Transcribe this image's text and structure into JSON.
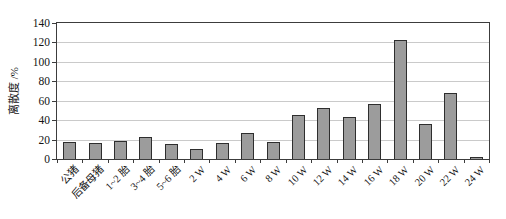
{
  "chart_data": {
    "type": "bar",
    "title": "",
    "xlabel": "",
    "ylabel": "离散度 /%",
    "categories": [
      "公猪",
      "后备母猪",
      "1~2 胎",
      "3~4 胎",
      "5~6 胎",
      "2 W",
      "4 W",
      "6 W",
      "8 W",
      "10 W",
      "12 W",
      "14 W",
      "16 W",
      "18 W",
      "20 W",
      "22 W",
      "24 W"
    ],
    "values": [
      18,
      16,
      19,
      23,
      15,
      10,
      16,
      27,
      18,
      45,
      52,
      43,
      57,
      122,
      36,
      68,
      2
    ],
    "ylim": [
      0,
      140
    ],
    "yticks": [
      0,
      20,
      40,
      60,
      80,
      100,
      120,
      140
    ],
    "grid": true,
    "legend": null,
    "colors": {
      "bar_fill": "#9c9c9c",
      "bar_border": "#2e2e2e",
      "grid": "#cacaca",
      "axis": "#3c3c3c",
      "text": "#141414",
      "background": "#ffffff"
    }
  }
}
